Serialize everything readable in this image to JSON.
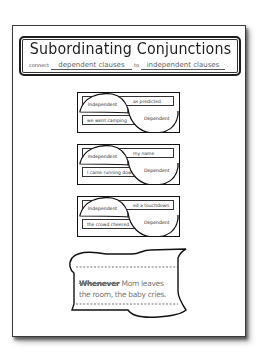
{
  "worksheet": {
    "title": "Subordinating Conjunctions",
    "subtitle": {
      "prefix": "connect",
      "blank_1": "dependent clauses",
      "middle": "to",
      "blank_2": "independent clauses",
      "suffix": "."
    },
    "cards": [
      {
        "independent_label": "Independent",
        "dependent_label": "Dependent",
        "top_clause": "as predicted",
        "bottom_clause": "we went camping"
      },
      {
        "independent_label": "Independent",
        "dependent_label": "Dependent",
        "top_clause": "my name",
        "bottom_clause": "I came running dow"
      },
      {
        "independent_label": "Independent",
        "dependent_label": "Dependent",
        "top_clause": "ed a touchdown",
        "bottom_clause": "the crowd cheered"
      }
    ],
    "flag": {
      "conjunction": "Whenever",
      "sentence_line_1": " Mom leaves",
      "sentence_line_2": "the room, the baby cries."
    }
  },
  "colors": {
    "ink": "#1e1e1e",
    "paper": "#ffffff",
    "faint_text": "#777777"
  }
}
